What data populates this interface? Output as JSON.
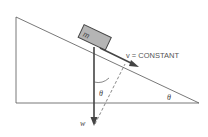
{
  "diagram": {
    "labels": {
      "mass": "m",
      "velocity": "v = CONSTANT",
      "weight": "w",
      "angle_between_weight_and_normal": "θ",
      "incline_angle": "θ"
    },
    "colors": {
      "line": "#444444",
      "block_fill": "#b5b5b5",
      "block_stroke": "#444444",
      "text": "#555555"
    }
  }
}
